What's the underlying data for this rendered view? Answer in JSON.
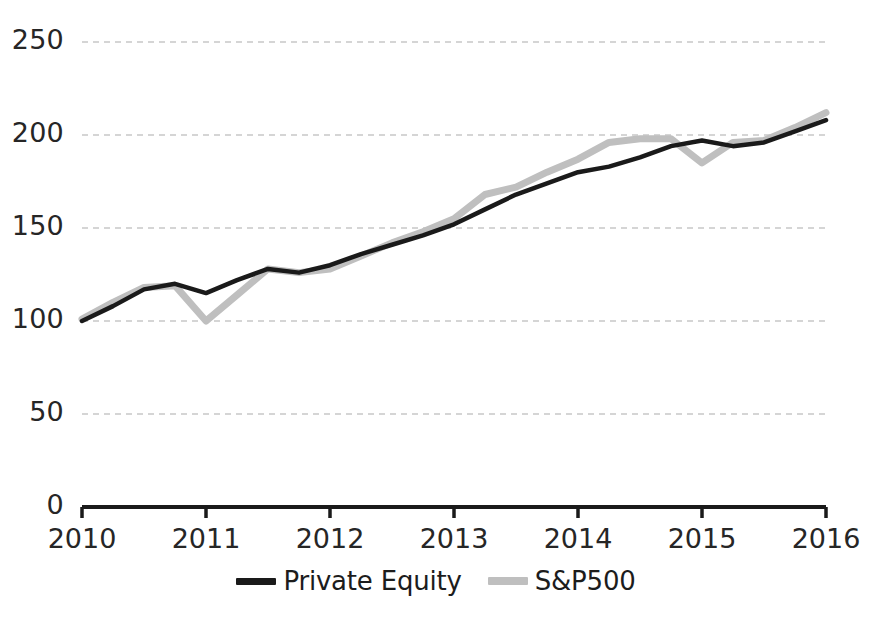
{
  "chart_data": {
    "type": "line",
    "title": "",
    "xlabel": "",
    "ylabel": "",
    "ylim": [
      0,
      250
    ],
    "yticks": [
      0,
      50,
      100,
      150,
      200,
      250
    ],
    "xlim": [
      2010,
      2016
    ],
    "xticks": [
      2010,
      2011,
      2012,
      2013,
      2014,
      2015,
      2016
    ],
    "xticklabels": [
      "2010",
      "2011",
      "2012",
      "2013",
      "2014",
      "2015",
      "2016"
    ],
    "yticklabels": [
      "0",
      "50",
      "100",
      "150",
      "200",
      "250"
    ],
    "grid": "horizontal-dashed",
    "legend_position": "bottom-center",
    "x": [
      2010.0,
      2010.25,
      2010.5,
      2010.75,
      2011.0,
      2011.25,
      2011.5,
      2011.75,
      2012.0,
      2012.25,
      2012.5,
      2012.75,
      2013.0,
      2013.25,
      2013.5,
      2013.75,
      2014.0,
      2014.25,
      2014.5,
      2014.75,
      2015.0,
      2015.25,
      2015.5,
      2015.75,
      2016.0
    ],
    "series": [
      {
        "name": "Private Equity",
        "color": "#1a1a1a",
        "values": [
          100,
          108,
          117,
          120,
          115,
          122,
          128,
          126,
          130,
          136,
          141,
          146,
          152,
          160,
          168,
          174,
          180,
          183,
          188,
          194,
          197,
          194,
          196,
          202,
          208
        ]
      },
      {
        "name": "S&P500",
        "color": "#bfbfbf",
        "values": [
          101,
          110,
          118,
          119,
          100,
          114,
          128,
          126,
          128,
          135,
          142,
          148,
          155,
          168,
          172,
          180,
          187,
          196,
          198,
          198,
          185,
          196,
          197,
          204,
          212
        ]
      }
    ]
  },
  "legend": {
    "items": [
      {
        "label": "Private Equity",
        "color": "#1a1a1a"
      },
      {
        "label": "S&P500",
        "color": "#bfbfbf"
      }
    ]
  }
}
